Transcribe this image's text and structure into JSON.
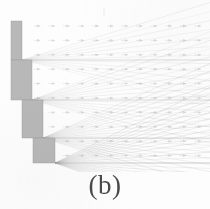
{
  "figure": {
    "caption": "(b)",
    "title": "",
    "background_color": "#fdfdfd",
    "obstacle_color": "#b8b8b8",
    "obstacle_edge_color": "#9a9a9a",
    "ray_color": "#9f9f9f",
    "grid_marker_color": "#bdbdbd"
  },
  "chart_data": {
    "type": "scatter",
    "title": "(b)",
    "subtitle": "",
    "xlabel": "",
    "ylabel": "",
    "xlim": [
      0,
      210
    ],
    "ylim": [
      0,
      172
    ],
    "grid": false,
    "legend": "none",
    "annotations": [
      "(b)"
    ],
    "obstacle": {
      "name": "staircase-obstacle",
      "fill": "#b8b8b8",
      "description": "Descending four-step staircase wall occupying the left portion of the domain",
      "steps": [
        {
          "x": 11,
          "y": 21,
          "width": 11,
          "height": 39
        },
        {
          "x": 11,
          "y": 60,
          "width": 21,
          "height": 40
        },
        {
          "x": 22,
          "y": 100,
          "width": 21,
          "height": 38
        },
        {
          "x": 33,
          "y": 138,
          "width": 22,
          "height": 25
        }
      ],
      "corners": [
        {
          "x": 22,
          "y": 60
        },
        {
          "x": 32,
          "y": 100
        },
        {
          "x": 43,
          "y": 138
        },
        {
          "x": 55,
          "y": 163
        }
      ]
    },
    "vector_field": {
      "name": "background-arrow-grid",
      "marker": "small-horizontal-arrow",
      "color": "#bdbdbd",
      "x_start": 38,
      "y_start": 26,
      "x_spacing": 14.6,
      "y_spacing": 14.4,
      "columns": 12,
      "rows": 10
    },
    "ray_fans": [
      {
        "origin_x": 22,
        "origin_y": 60,
        "count": 13,
        "angle_min_deg": -14,
        "angle_max_deg": 17,
        "opacity": 0.3
      },
      {
        "origin_x": 32,
        "origin_y": 100,
        "count": 16,
        "angle_min_deg": -16,
        "angle_max_deg": 21,
        "opacity": 0.34
      },
      {
        "origin_x": 43,
        "origin_y": 138,
        "count": 20,
        "angle_min_deg": -18,
        "angle_max_deg": 24,
        "opacity": 0.4
      },
      {
        "origin_x": 55,
        "origin_y": 163,
        "count": 24,
        "angle_min_deg": -20,
        "angle_max_deg": 26,
        "opacity": 0.46
      }
    ],
    "horizontal_interfaces": [
      {
        "y": 60,
        "x_start": 22,
        "x_end": 210
      },
      {
        "y": 100,
        "x_start": 32,
        "x_end": 210
      },
      {
        "y": 138,
        "x_start": 43,
        "x_end": 210
      },
      {
        "y": 163,
        "x_start": 55,
        "x_end": 210
      }
    ],
    "top_tick": {
      "x": 104,
      "y_start": 8,
      "y_end": 16
    }
  }
}
